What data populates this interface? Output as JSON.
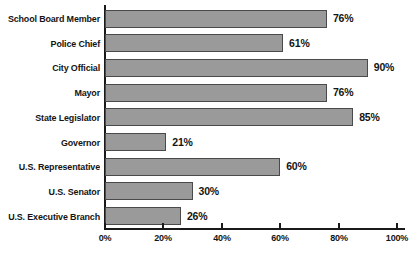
{
  "chart_data": {
    "type": "bar",
    "orientation": "horizontal",
    "title": "",
    "subtitle": "",
    "xlabel": "",
    "ylabel": "",
    "xlim": [
      0,
      100
    ],
    "grid": false,
    "legend": null,
    "unit": "%",
    "categories": [
      "School Board Member",
      "Police Chief",
      "City Official",
      "Mayor",
      "State Legislator",
      "Governor",
      "U.S. Representative",
      "U.S. Senator",
      "U.S. Executive Branch"
    ],
    "values": [
      76,
      61,
      90,
      76,
      85,
      21,
      60,
      30,
      26
    ],
    "data_labels": [
      "76%",
      "61%",
      "90%",
      "76%",
      "85%",
      "21%",
      "60%",
      "30%",
      "26%"
    ],
    "xticks": [
      0,
      20,
      40,
      60,
      80,
      100
    ],
    "xtick_labels": [
      "0%",
      "20%",
      "40%",
      "60%",
      "80%",
      "100%"
    ],
    "colors": {
      "bar_fill": "#9a9a9a",
      "bar_border": "#4a4a4a",
      "axis": "#1a1a1a",
      "text": "#141414",
      "background": "#ffffff"
    }
  }
}
